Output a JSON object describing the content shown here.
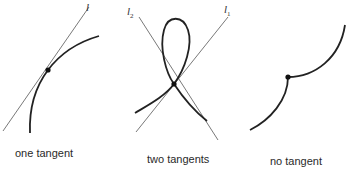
{
  "figure": {
    "panels": [
      {
        "id": "one-tangent",
        "caption": "one tangent",
        "lines": [
          {
            "label": "l",
            "subscript": ""
          }
        ]
      },
      {
        "id": "two-tangents",
        "caption": "two tangents",
        "lines": [
          {
            "label": "l",
            "subscript": "2"
          },
          {
            "label": "l",
            "subscript": "1"
          }
        ]
      },
      {
        "id": "no-tangent",
        "caption": "no tangent",
        "lines": []
      }
    ],
    "colors": {
      "curve": "#222222",
      "tangent_line": "#555555",
      "point": "#111111",
      "text": "#2a2a2a"
    }
  }
}
